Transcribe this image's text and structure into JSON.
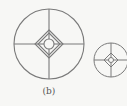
{
  "figure": {
    "caption": "(b)",
    "stroke_color": "#7a7a7a",
    "background": "#f7f7f5",
    "symbols": [
      {
        "name": "large-reticle",
        "cx": 49,
        "cy": 44,
        "r": 35,
        "diamond_half": 14,
        "inner_r": 5
      },
      {
        "name": "small-reticle",
        "cx": 111,
        "cy": 60,
        "r": 17,
        "diamond_half": 7,
        "inner_r": 2.5
      }
    ]
  }
}
